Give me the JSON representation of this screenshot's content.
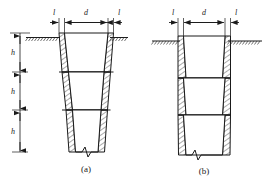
{
  "figure": {
    "domain": "engineering-drawing",
    "colors": {
      "line": "#1a1a1a",
      "hatch": "#2b2b2b",
      "background": "#ffffff",
      "ground": "#333333"
    },
    "panels": [
      {
        "id": "a",
        "caption": "(a)",
        "type": "tapered-stepped-shaft",
        "wall_label_left": "l",
        "wall_label_right": "l",
        "clear_span_label": "d",
        "lift_labels": [
          "h",
          "h",
          "h"
        ],
        "lift_count": 3
      },
      {
        "id": "b",
        "caption": "(b)",
        "type": "straight-outer-wall-shaft",
        "wall_label_left": "l",
        "wall_label_right": "l",
        "clear_span_label": "d",
        "lift_count": 3
      }
    ],
    "dimensions": {
      "thickness_label": "l",
      "span_label": "d",
      "height_label": "h"
    },
    "symbols": {
      "ground_line": "ground-hatch",
      "break_line": "zigzag-break",
      "wall_fill": "diagonal-hatch",
      "arrow": "dimension-arrow"
    }
  }
}
